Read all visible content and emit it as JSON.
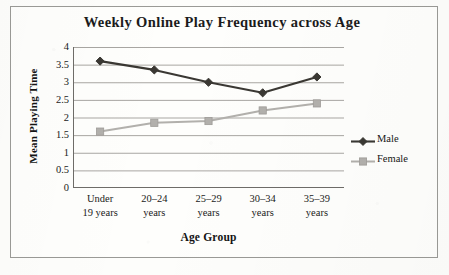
{
  "chart_data": {
    "type": "line",
    "title": "Weekly Online Play Frequency across Age",
    "xlabel": "Age Group",
    "ylabel": "Mean Playing Time",
    "categories": [
      "Under 19 years",
      "20–24 years",
      "25–29 years",
      "30–34 years",
      "35–39 years"
    ],
    "category_lines": [
      [
        "Under",
        "19 years"
      ],
      [
        "20–24",
        "years"
      ],
      [
        "25–29",
        "years"
      ],
      [
        "30–34",
        "years"
      ],
      [
        "35–39",
        "years"
      ]
    ],
    "series": [
      {
        "name": "Male",
        "values": [
          3.6,
          3.35,
          3.0,
          2.7,
          3.15
        ],
        "color": "#3a3833",
        "marker": "diamond"
      },
      {
        "name": "Female",
        "values": [
          1.6,
          1.85,
          1.9,
          2.2,
          2.4
        ],
        "color": "#b2b0ac",
        "marker": "square"
      }
    ],
    "ylim": [
      0,
      4
    ],
    "yticks": [
      "4",
      "3.5",
      "3",
      "2.5",
      "2",
      "1.5",
      "1",
      "0.5",
      "0"
    ],
    "ytick_values": [
      4,
      3.5,
      3,
      2.5,
      2,
      1.5,
      1,
      0.5,
      0
    ],
    "grid": true,
    "grid_axis": "y",
    "legend_position": "right",
    "legend_entries": [
      "Male",
      "Female"
    ]
  }
}
